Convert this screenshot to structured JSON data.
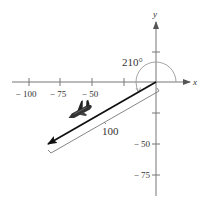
{
  "diagram": {
    "type": "vector-bearing",
    "angle_label": "210°",
    "angle_degrees": 210,
    "magnitude_label": "100",
    "magnitude": 100,
    "axes": {
      "x_label": "x",
      "y_label": "y",
      "x_ticks": [
        {
          "value": -100,
          "label": "− 100"
        },
        {
          "value": -75,
          "label": "− 75"
        },
        {
          "value": -50,
          "label": "− 50"
        },
        {
          "value": -25,
          "label": ""
        }
      ],
      "y_ticks": [
        {
          "value": 25,
          "label": ""
        },
        {
          "value": -25,
          "label": ""
        },
        {
          "value": -50,
          "label": "− 50"
        },
        {
          "value": -75,
          "label": "− 75"
        }
      ]
    },
    "icon": "airplane-icon",
    "colors": {
      "axis": "#777777",
      "vector": "#111111",
      "arc": "#999999",
      "text": "#333333"
    }
  }
}
